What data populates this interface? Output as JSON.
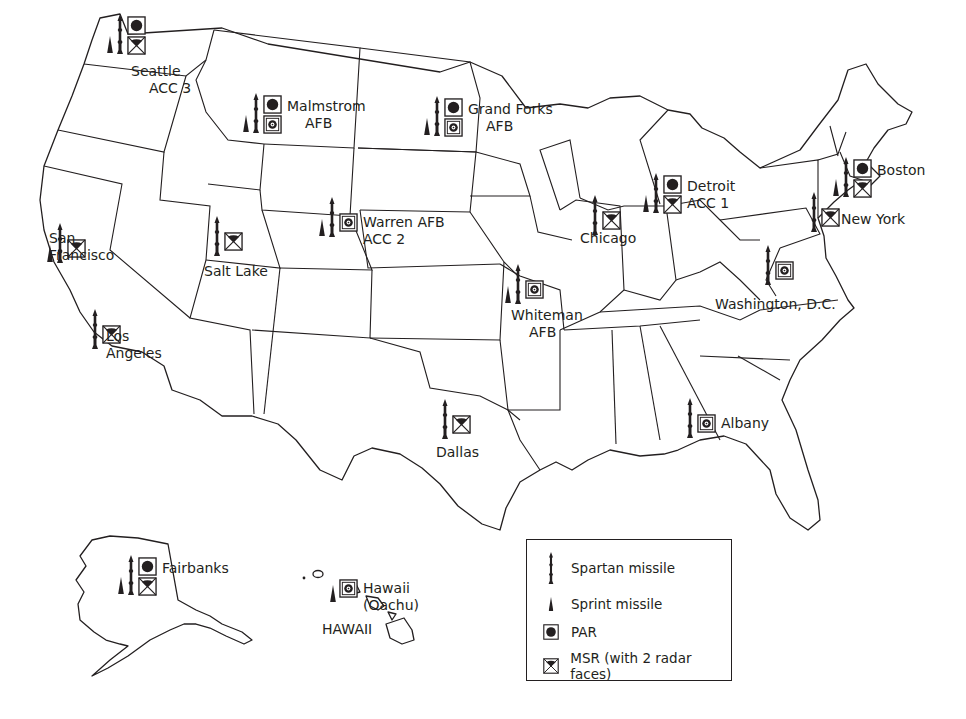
{
  "map": {
    "title": "ABM Sites (Spartan / Sprint deployment)",
    "colors": {
      "ink": "#231f20",
      "background": "#ffffff"
    }
  },
  "sites": [
    {
      "id": "seattle",
      "label_lines": [
        "Seattle",
        "ACC 3"
      ],
      "spartan": true,
      "sprint": true,
      "par": true,
      "msr": "msr",
      "x": 107,
      "y": 14
    },
    {
      "id": "malmstrom",
      "label_lines": [
        "Malmstrom",
        "AFB"
      ],
      "spartan": true,
      "sprint": true,
      "par": true,
      "msr": "msr-site",
      "x": 243,
      "y": 93
    },
    {
      "id": "grand-forks",
      "label_lines": [
        "Grand Forks",
        "AFB"
      ],
      "spartan": true,
      "sprint": true,
      "par": true,
      "msr": "msr-site",
      "x": 424,
      "y": 96
    },
    {
      "id": "detroit",
      "label_lines": [
        "Detroit",
        "ACC 1"
      ],
      "spartan": true,
      "sprint": true,
      "par": true,
      "msr": "msr",
      "x": 643,
      "y": 173
    },
    {
      "id": "boston",
      "label_lines": [
        "Boston"
      ],
      "spartan": true,
      "sprint": true,
      "par": true,
      "msr": "msr",
      "x": 833,
      "y": 157
    },
    {
      "id": "new-york",
      "label_lines": [
        "New York"
      ],
      "spartan": true,
      "sprint": false,
      "par": false,
      "msr": "msr",
      "x": 810,
      "y": 192
    },
    {
      "id": "warren",
      "label_lines": [
        "Warren AFB",
        "ACC 2"
      ],
      "spartan": true,
      "sprint": true,
      "par": false,
      "msr": "msr-site",
      "x": 319,
      "y": 197
    },
    {
      "id": "chicago",
      "label_lines": [
        "Chicago"
      ],
      "spartan": true,
      "sprint": false,
      "par": false,
      "msr": "msr",
      "x": 591,
      "y": 195
    },
    {
      "id": "san-francisco",
      "label_lines": [
        "San",
        "Francisco"
      ],
      "spartan": true,
      "sprint": true,
      "par": false,
      "msr": "msr",
      "x": 47,
      "y": 223
    },
    {
      "id": "salt-lake",
      "label_lines": [
        "Salt Lake"
      ],
      "spartan": true,
      "sprint": false,
      "par": false,
      "msr": "msr",
      "x": 213,
      "y": 216
    },
    {
      "id": "whiteman",
      "label_lines": [
        "Whiteman",
        "AFB"
      ],
      "spartan": true,
      "sprint": true,
      "par": false,
      "msr": "msr-site",
      "x": 505,
      "y": 264
    },
    {
      "id": "washington",
      "label_lines": [
        "Washington, D.C."
      ],
      "spartan": true,
      "sprint": false,
      "par": false,
      "msr": "msr-site",
      "x": 764,
      "y": 245
    },
    {
      "id": "los-angeles",
      "label_lines": [
        "Los",
        "Angeles"
      ],
      "spartan": true,
      "sprint": false,
      "par": false,
      "msr": "msr",
      "x": 91,
      "y": 309
    },
    {
      "id": "dallas",
      "label_lines": [
        "Dallas"
      ],
      "spartan": true,
      "sprint": false,
      "par": false,
      "msr": "msr",
      "x": 441,
      "y": 399
    },
    {
      "id": "albany",
      "label_lines": [
        "Albany"
      ],
      "spartan": true,
      "sprint": false,
      "par": false,
      "msr": "msr-site",
      "x": 686,
      "y": 398
    },
    {
      "id": "fairbanks",
      "label_lines": [
        "Fairbanks"
      ],
      "spartan": true,
      "sprint": true,
      "par": true,
      "msr": "msr",
      "x": 118,
      "y": 555
    },
    {
      "id": "hawaii-oahu",
      "label_lines": [
        "Hawaii",
        "(Oachu)"
      ],
      "spartan": false,
      "sprint": true,
      "par": false,
      "msr": "msr-site",
      "x": 330,
      "y": 563
    }
  ],
  "region_labels": [
    {
      "id": "hawaii-state",
      "text": "HAWAII",
      "x": 322,
      "y": 634
    }
  ],
  "legend": {
    "items": [
      {
        "icon": "spartan-missile-icon",
        "label": "Spartan missile"
      },
      {
        "icon": "sprint-missile-icon",
        "label": "Sprint missile"
      },
      {
        "icon": "par-radar-icon",
        "label": "PAR"
      },
      {
        "icon": "msr-radar-icon",
        "label": "MSR (with 2 radar faces)"
      }
    ]
  }
}
